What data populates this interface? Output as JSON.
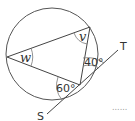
{
  "diagram": {
    "angle_w_label": "w",
    "angle_v_label": "v",
    "angle_40_label": "40°",
    "angle_60_label": "60°",
    "point_t_label": "T",
    "point_s_label": "S",
    "answer_dots": "......"
  },
  "colors": {
    "stroke": "#444444",
    "text": "#333333"
  }
}
